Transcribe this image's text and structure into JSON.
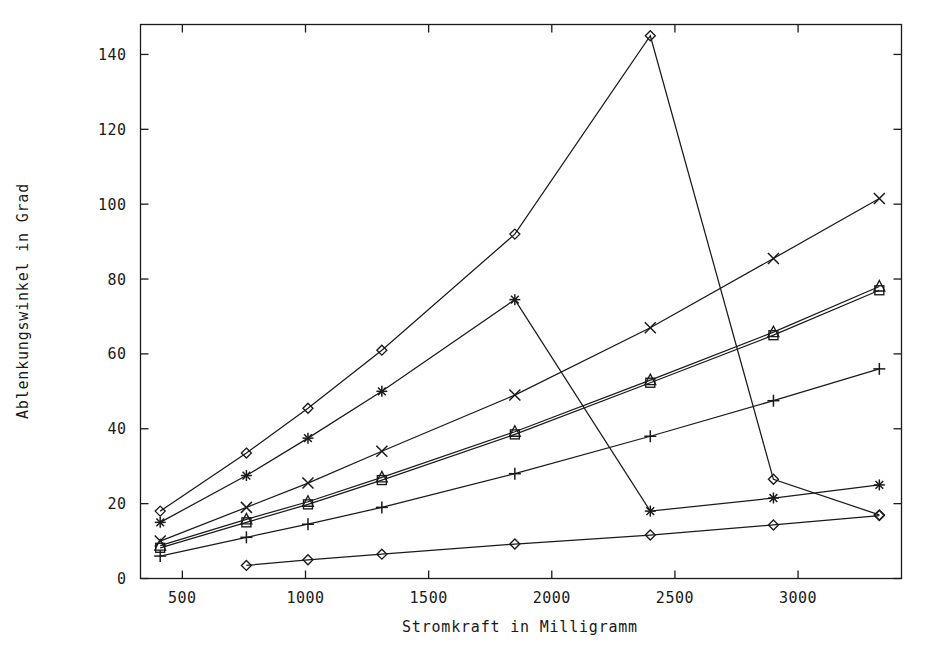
{
  "chart_data": {
    "type": "line",
    "title": "",
    "xlabel": "Stromkraft in Milligramm",
    "ylabel": "Ablenkungswinkel in Grad",
    "xlim": [
      330,
      3420
    ],
    "ylim": [
      0,
      148
    ],
    "xticks": [
      500,
      1000,
      1500,
      2000,
      2500,
      3000
    ],
    "xticklabels": [
      "500",
      "1000",
      "1500",
      "2000",
      "2500",
      "3000"
    ],
    "yticks": [
      0,
      20,
      40,
      60,
      80,
      100,
      120,
      140
    ],
    "yticklabels": [
      "0",
      "20",
      "40",
      "60",
      "80",
      "100",
      "120",
      "140"
    ],
    "grid": false,
    "legend": "none",
    "series": [
      {
        "name": "series-diamond-peak",
        "marker": "diamond",
        "x": [
          410,
          760,
          1010,
          1310,
          1850,
          2400,
          2900,
          3330
        ],
        "y": [
          18.0,
          33.5,
          45.5,
          61.0,
          92.0,
          145.0,
          26.5,
          17.0
        ]
      },
      {
        "name": "series-asterisk-peak",
        "marker": "asterisk",
        "x": [
          410,
          760,
          1010,
          1310,
          1850,
          2400,
          2900,
          3330
        ],
        "y": [
          15.0,
          27.5,
          37.5,
          50.0,
          74.5,
          18.0,
          21.5,
          25.0
        ]
      },
      {
        "name": "series-cross",
        "marker": "cross",
        "x": [
          410,
          760,
          1010,
          1310,
          1850,
          2400,
          2900,
          3330
        ],
        "y": [
          10.0,
          19.0,
          25.5,
          34.0,
          49.0,
          67.0,
          85.5,
          101.5
        ]
      },
      {
        "name": "series-triangle",
        "marker": "triangle",
        "x": [
          410,
          760,
          1010,
          1310,
          1850,
          2400,
          2900,
          3330
        ],
        "y": [
          8.8,
          15.8,
          20.5,
          27.0,
          39.2,
          53.0,
          65.8,
          78.0
        ]
      },
      {
        "name": "series-square",
        "marker": "square",
        "x": [
          410,
          760,
          1010,
          1310,
          1850,
          2400,
          2900,
          3330
        ],
        "y": [
          8.2,
          15.0,
          19.8,
          26.3,
          38.5,
          52.3,
          65.0,
          77.0
        ]
      },
      {
        "name": "series-plus",
        "marker": "plus",
        "x": [
          410,
          760,
          1010,
          1310,
          1850,
          2400,
          2900,
          3330
        ],
        "y": [
          6.0,
          11.0,
          14.5,
          19.0,
          28.0,
          38.0,
          47.5,
          56.0
        ]
      },
      {
        "name": "series-diamond-low",
        "marker": "diamond",
        "x": [
          760,
          1010,
          1310,
          1850,
          2400,
          2900,
          3330
        ],
        "y": [
          3.5,
          5.0,
          6.5,
          9.2,
          11.6,
          14.3,
          16.8
        ]
      }
    ],
    "colors": {
      "line": "#1a1a1a",
      "marker": "#1a1a1a",
      "axis": "#1a1a1a",
      "background": "#ffffff"
    }
  }
}
